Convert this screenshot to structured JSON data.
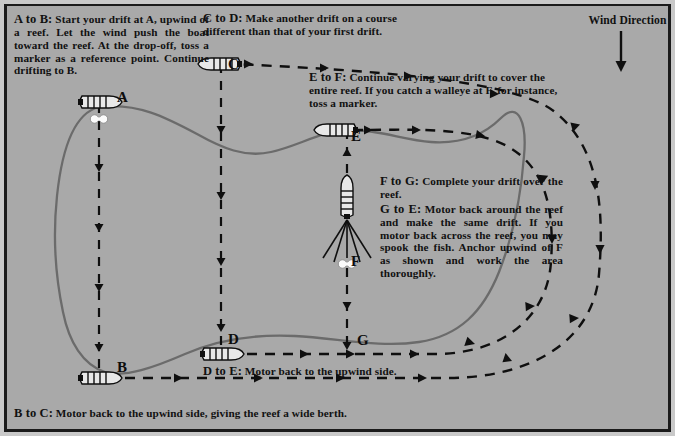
{
  "diagram": {
    "background_color": "#a9a9a9",
    "frame_color": "#1b1b1b",
    "ink_color": "#111111",
    "reef_outline_color": "#6b6b6b"
  },
  "wind": {
    "label": "Wind Direction",
    "arrow_icon": "down-arrow-icon",
    "direction": "down"
  },
  "callouts": {
    "ab": {
      "lead": "A to B:",
      "body": " Start your drift at A, upwind of a reef. Let the wind push the boat toward the reef. At the drop-off, toss a marker as a reference point. Continue drifting to B."
    },
    "cd": {
      "lead": "C to D:",
      "body": " Make another drift on a course different than that of your first drift."
    },
    "ef": {
      "lead": "E to F:",
      "body": " Continue varying your drift to cover the entire reef. If you catch a walleye at F, for instance, toss a marker."
    },
    "fg": {
      "lead": "F to G:",
      "body": " Complete your drift over the reef."
    },
    "ge": {
      "lead": "G to E:",
      "body": " Motor back around the reef and make the same drift. If you motor back across the reef, you may spook the fish. Anchor upwind of F as shown and work the area thoroughly."
    },
    "de": {
      "lead": "D to E:",
      "body": " Motor back to the upwind side."
    },
    "bc": {
      "lead": "B to C:",
      "body": " Motor back to the upwind side, giving the reef a wide berth."
    }
  },
  "points": [
    {
      "id": "A",
      "label": "A",
      "x": 92,
      "y": 96,
      "boat_heading": "right",
      "has_marker_buoy": true
    },
    {
      "id": "B",
      "label": "B",
      "x": 92,
      "y": 372,
      "boat_heading": "right",
      "has_marker_buoy": false
    },
    {
      "id": "C",
      "label": "C",
      "x": 214,
      "y": 56,
      "boat_heading": "left",
      "has_marker_buoy": false
    },
    {
      "id": "D",
      "label": "D",
      "x": 214,
      "y": 348,
      "boat_heading": "right",
      "has_marker_buoy": false
    },
    {
      "id": "E",
      "label": "E",
      "x": 330,
      "y": 122,
      "boat_heading": "left",
      "has_marker_buoy": false
    },
    {
      "id": "F",
      "label": "F",
      "x": 340,
      "y": 200,
      "boat_heading": "up",
      "has_marker_buoy": true,
      "anchored": true
    },
    {
      "id": "G",
      "label": "G",
      "x": 340,
      "y": 340,
      "boat_heading": "none",
      "has_marker_buoy": false
    }
  ],
  "drift_lines": [
    {
      "name": "drift-A-to-B",
      "from": "A",
      "to": "B",
      "style": "dashed",
      "arrow_direction": "down"
    },
    {
      "name": "drift-C-to-D",
      "from": "C",
      "to": "D",
      "style": "dashed",
      "arrow_direction": "down"
    },
    {
      "name": "drift-E-to-F-to-G",
      "from": "E",
      "to": "G",
      "style": "dashed",
      "arrow_direction": "down"
    }
  ],
  "motor_lines": [
    {
      "name": "motor-B-to-C",
      "from": "B",
      "to": "C",
      "style": "dashed",
      "arrow_direction": "right-then-up-around"
    },
    {
      "name": "motor-D-to-E",
      "from": "D",
      "to": "E",
      "style": "dashed",
      "arrow_direction": "right-then-up-around"
    }
  ],
  "icons": {
    "boat": "boat-icon",
    "marker_buoy": "marker-buoy-icon",
    "anchor_lines": "anchor-lines-icon",
    "wind_arrow": "down-arrow-icon"
  }
}
